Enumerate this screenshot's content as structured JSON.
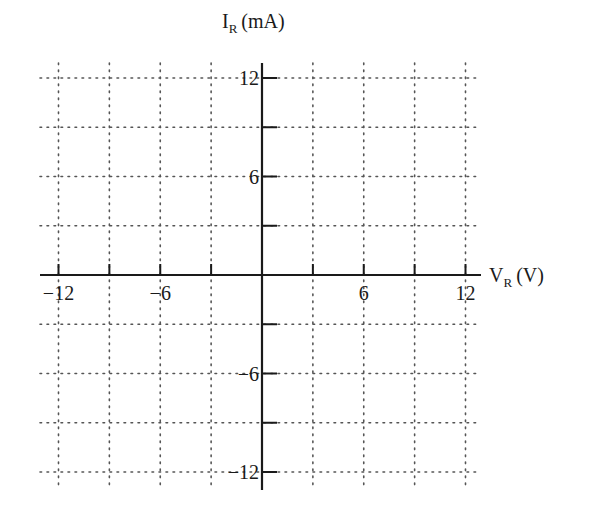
{
  "chart_data": {
    "type": "line",
    "title": "",
    "xlabel": "V",
    "xlabel_sub": "R",
    "xlabel_unit": "(V)",
    "ylabel": "I",
    "ylabel_sub": "R",
    "ylabel_unit": "(mA)",
    "xlim": [
      -12,
      12
    ],
    "ylim": [
      -12,
      12
    ],
    "x_ticks": [
      -12,
      -9,
      -6,
      -3,
      3,
      6,
      9,
      12
    ],
    "y_ticks": [
      -12,
      -9,
      -6,
      -3,
      3,
      6,
      9,
      12
    ],
    "x_tick_labels": [
      {
        "value": -12,
        "label": "−12"
      },
      {
        "value": -6,
        "label": "−6"
      },
      {
        "value": 6,
        "label": "6"
      },
      {
        "value": 12,
        "label": "12"
      }
    ],
    "y_tick_labels": [
      {
        "value": 12,
        "label": "12"
      },
      {
        "value": 6,
        "label": "6"
      },
      {
        "value": -6,
        "label": "−6"
      },
      {
        "value": -12,
        "label": "−12"
      }
    ],
    "grid": true,
    "grid_style": "dotted",
    "series": []
  },
  "colors": {
    "axis": "#1a1a1a",
    "grid": "#555555",
    "background": "#ffffff"
  }
}
